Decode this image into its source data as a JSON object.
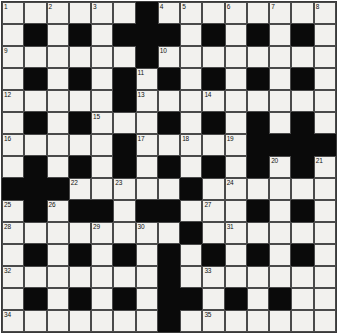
{
  "puzzle": {
    "type": "crossword-grid",
    "title": "Crossword Puzzle Grid",
    "rows": 15,
    "cols": 15,
    "colors": {
      "white_cell": "#f2f1ee",
      "black_cell": "#0a0a0a",
      "grid_line": "#4a4a4a",
      "number_text": "#111111",
      "page_background": "#ffffff"
    },
    "legend": {
      "white": "open letter square",
      "black": "blocked square"
    },
    "grid": [
      [
        "w",
        "w",
        "w",
        "w",
        "w",
        "w",
        "b",
        "w",
        "w",
        "w",
        "w",
        "w",
        "w",
        "w",
        "w"
      ],
      [
        "w",
        "b",
        "w",
        "b",
        "w",
        "b",
        "b",
        "b",
        "w",
        "b",
        "w",
        "b",
        "w",
        "b",
        "w"
      ],
      [
        "w",
        "w",
        "w",
        "w",
        "w",
        "w",
        "b",
        "w",
        "w",
        "w",
        "w",
        "w",
        "w",
        "w",
        "w"
      ],
      [
        "w",
        "b",
        "w",
        "b",
        "w",
        "b",
        "w",
        "b",
        "w",
        "b",
        "w",
        "b",
        "w",
        "b",
        "w"
      ],
      [
        "w",
        "w",
        "w",
        "w",
        "w",
        "b",
        "w",
        "w",
        "w",
        "w",
        "w",
        "w",
        "w",
        "w",
        "w"
      ],
      [
        "w",
        "b",
        "w",
        "b",
        "w",
        "w",
        "w",
        "b",
        "w",
        "b",
        "w",
        "b",
        "w",
        "b",
        "w"
      ],
      [
        "w",
        "w",
        "w",
        "w",
        "w",
        "b",
        "w",
        "w",
        "w",
        "w",
        "w",
        "b",
        "b",
        "b",
        "b"
      ],
      [
        "w",
        "b",
        "w",
        "b",
        "w",
        "b",
        "w",
        "b",
        "w",
        "b",
        "w",
        "b",
        "w",
        "b",
        "w"
      ],
      [
        "b",
        "b",
        "b",
        "w",
        "w",
        "w",
        "w",
        "w",
        "b",
        "w",
        "w",
        "w",
        "w",
        "w",
        "w"
      ],
      [
        "w",
        "b",
        "w",
        "b",
        "b",
        "w",
        "b",
        "b",
        "w",
        "w",
        "w",
        "b",
        "w",
        "b",
        "w"
      ],
      [
        "w",
        "w",
        "w",
        "w",
        "w",
        "w",
        "w",
        "w",
        "b",
        "w",
        "w",
        "w",
        "w",
        "w",
        "w"
      ],
      [
        "w",
        "b",
        "w",
        "b",
        "w",
        "b",
        "w",
        "b",
        "w",
        "b",
        "w",
        "b",
        "w",
        "b",
        "w"
      ],
      [
        "w",
        "w",
        "w",
        "w",
        "w",
        "w",
        "w",
        "b",
        "w",
        "w",
        "w",
        "w",
        "w",
        "w",
        "w"
      ],
      [
        "w",
        "b",
        "w",
        "b",
        "w",
        "b",
        "w",
        "b",
        "b",
        "w",
        "b",
        "w",
        "b",
        "w",
        "w"
      ],
      [
        "w",
        "w",
        "w",
        "w",
        "w",
        "w",
        "w",
        "b",
        "w",
        "w",
        "w",
        "w",
        "w",
        "w",
        "w"
      ]
    ],
    "numbers": [
      {
        "row": 0,
        "col": 0,
        "n": "1"
      },
      {
        "row": 0,
        "col": 2,
        "n": "2"
      },
      {
        "row": 0,
        "col": 4,
        "n": "3"
      },
      {
        "row": 0,
        "col": 7,
        "n": "4"
      },
      {
        "row": 0,
        "col": 8,
        "n": "5"
      },
      {
        "row": 0,
        "col": 10,
        "n": "6"
      },
      {
        "row": 0,
        "col": 12,
        "n": "7"
      },
      {
        "row": 0,
        "col": 14,
        "n": "8"
      },
      {
        "row": 2,
        "col": 0,
        "n": "9"
      },
      {
        "row": 2,
        "col": 7,
        "n": "10"
      },
      {
        "row": 3,
        "col": 6,
        "n": "11"
      },
      {
        "row": 4,
        "col": 0,
        "n": "12"
      },
      {
        "row": 4,
        "col": 6,
        "n": "13"
      },
      {
        "row": 4,
        "col": 9,
        "n": "14"
      },
      {
        "row": 5,
        "col": 4,
        "n": "15"
      },
      {
        "row": 6,
        "col": 0,
        "n": "16"
      },
      {
        "row": 6,
        "col": 6,
        "n": "17"
      },
      {
        "row": 6,
        "col": 8,
        "n": "18"
      },
      {
        "row": 6,
        "col": 10,
        "n": "19"
      },
      {
        "row": 7,
        "col": 12,
        "n": "20"
      },
      {
        "row": 7,
        "col": 14,
        "n": "21"
      },
      {
        "row": 8,
        "col": 3,
        "n": "22"
      },
      {
        "row": 8,
        "col": 5,
        "n": "23"
      },
      {
        "row": 8,
        "col": 10,
        "n": "24"
      },
      {
        "row": 9,
        "col": 0,
        "n": "25"
      },
      {
        "row": 9,
        "col": 2,
        "n": "26"
      },
      {
        "row": 9,
        "col": 9,
        "n": "27"
      },
      {
        "row": 10,
        "col": 0,
        "n": "28"
      },
      {
        "row": 10,
        "col": 4,
        "n": "29"
      },
      {
        "row": 10,
        "col": 6,
        "n": "30"
      },
      {
        "row": 10,
        "col": 10,
        "n": "31"
      },
      {
        "row": 12,
        "col": 0,
        "n": "32"
      },
      {
        "row": 12,
        "col": 9,
        "n": "33"
      },
      {
        "row": 14,
        "col": 0,
        "n": "34"
      },
      {
        "row": 14,
        "col": 9,
        "n": "35"
      }
    ]
  }
}
